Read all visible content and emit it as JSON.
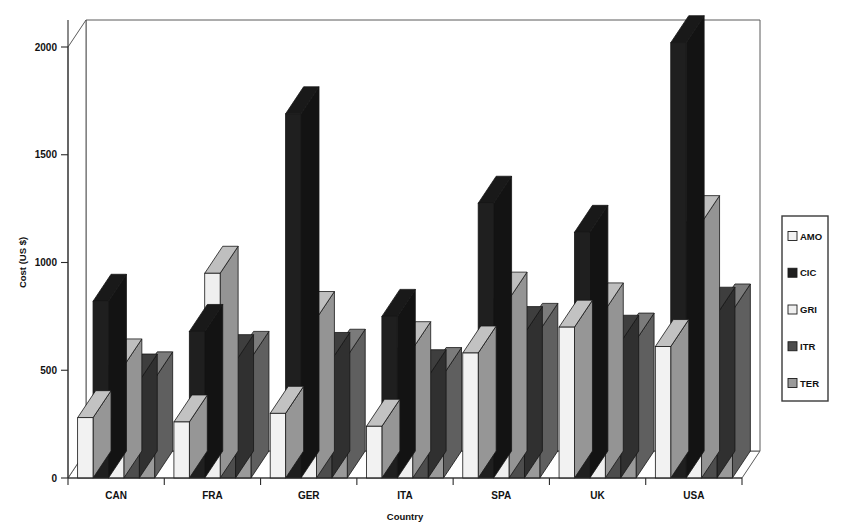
{
  "chart_data": {
    "type": "bar",
    "title": "",
    "subtitle": "",
    "xlabel": "Country",
    "ylabel": "Cost (US $)",
    "categories": [
      "CAN",
      "FRA",
      "GER",
      "ITA",
      "SPA",
      "UK",
      "USA"
    ],
    "ylim": [
      0,
      2100
    ],
    "yticks": [
      0,
      500,
      1000,
      1500,
      2000
    ],
    "ytick_labels": [
      "0",
      "500",
      "1000",
      "1500",
      "2000"
    ],
    "grid": false,
    "legend_position": "right",
    "style": "3d-grouped-bars-grayscale",
    "series": [
      {
        "name": "AMO",
        "color": "#f2f2f2",
        "values": [
          280,
          260,
          300,
          240,
          580,
          700,
          610
        ]
      },
      {
        "name": "CIC",
        "color": "#1f1f1f",
        "values": [
          820,
          680,
          1690,
          750,
          1275,
          1140,
          2020
        ]
      },
      {
        "name": "GRI",
        "color": "#efefef",
        "values": [
          520,
          950,
          740,
          600,
          830,
          780,
          1185
        ]
      },
      {
        "name": "ITR",
        "color": "#4d4d4d",
        "values": [
          450,
          540,
          550,
          470,
          670,
          630,
          760
        ]
      },
      {
        "name": "TER",
        "color": "#9a9a9a",
        "values": [
          460,
          555,
          565,
          480,
          685,
          640,
          775
        ]
      }
    ]
  },
  "legend": {
    "entries": [
      {
        "label": "AMO",
        "swatch": "white-swatch-icon"
      },
      {
        "label": "CIC",
        "swatch": "black-swatch-icon"
      },
      {
        "label": "GRI",
        "swatch": "white-swatch-icon"
      },
      {
        "label": "ITR",
        "swatch": "dark-gray-swatch-icon"
      },
      {
        "label": "TER",
        "swatch": "mid-gray-swatch-icon"
      }
    ]
  },
  "axes": {
    "y_title": "Cost (US $)",
    "x_title": "Country"
  },
  "colors": {
    "amo": "#f2f2f2",
    "cic": "#1f1f1f",
    "gri": "#efefef",
    "itr": "#4d4d4d",
    "ter": "#9a9a9a",
    "axis": "#2b2b2b",
    "frame": "#4a4a4a",
    "background": "#ffffff"
  }
}
